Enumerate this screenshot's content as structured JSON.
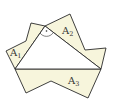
{
  "diagram": {
    "fill_color": "#f7f5dc",
    "stroke_color": "#2a2a2a",
    "triangle": {
      "vertices": [
        [
          45,
          26
        ],
        [
          15,
          69
        ],
        [
          101,
          69
        ]
      ],
      "right_angle_vertex": [
        45,
        26
      ]
    },
    "regions": [
      {
        "id": "A1",
        "label": "A",
        "subscript": "1",
        "label_pos": [
          10,
          56
        ],
        "points": [
          [
            15,
            69
          ],
          [
            6,
            51
          ],
          [
            26,
            41
          ],
          [
            31,
            23
          ],
          [
            45,
            26
          ]
        ]
      },
      {
        "id": "A2",
        "label": "A",
        "subscript": "2",
        "label_pos": [
          62,
          34
        ],
        "points": [
          [
            45,
            26
          ],
          [
            70,
            14
          ],
          [
            85,
            50
          ],
          [
            106,
            48
          ],
          [
            101,
            69
          ]
        ]
      },
      {
        "id": "A3",
        "label": "A",
        "subscript": "3",
        "label_pos": [
          68,
          84
        ],
        "points": [
          [
            15,
            69
          ],
          [
            26,
            93
          ],
          [
            51,
            81
          ],
          [
            88,
            98
          ],
          [
            101,
            69
          ]
        ]
      }
    ]
  }
}
